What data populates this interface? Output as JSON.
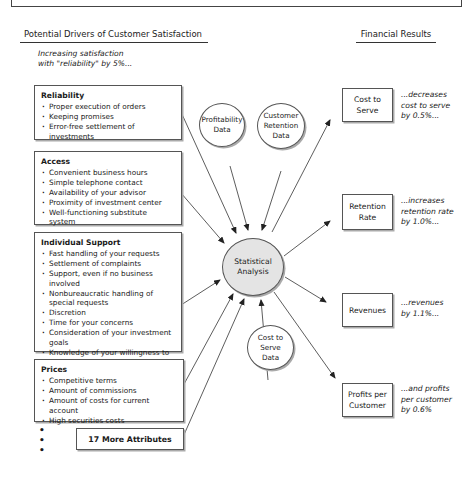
{
  "headers": {
    "drivers": "Potential Drivers of Customer Satisfaction",
    "results": "Financial Results"
  },
  "intro": {
    "line1": "Increasing satisfaction",
    "line2": "with \"reliability\" by 5%..."
  },
  "drivers": [
    {
      "title": "Reliability",
      "items": [
        "Proper execution of orders",
        "Keeping promises",
        "Error-free settlement of investments"
      ]
    },
    {
      "title": "Access",
      "items": [
        "Convenient business hours",
        "Simple telephone contact",
        "Availability of your advisor",
        "Proximity of investment center",
        "Well-functioning substitute system"
      ]
    },
    {
      "title": "Individual Support",
      "items": [
        "Fast handling of your requests",
        "Settlement of complaints",
        "Support, even if no business involved",
        "Nonbureaucratic handling of special requests",
        "Discretion",
        "Time for your concerns",
        "Consideration of your investment goals",
        "Knowledge of your willingness to take risks"
      ]
    },
    {
      "title": "Prices",
      "items": [
        "Competitive terms",
        "Amount of commissions",
        "Amount of costs for current account",
        "High securities costs"
      ]
    }
  ],
  "more_attributes": "17 More Attributes",
  "ellipsis_dots": [
    "•",
    "•",
    "•"
  ],
  "data_sources": {
    "profitability": [
      "Profitability",
      "Data"
    ],
    "retention": [
      "Customer",
      "Retention",
      "Data"
    ],
    "cost_to_serve": [
      "Cost to",
      "Serve",
      "Data"
    ]
  },
  "center": [
    "Statistical",
    "Analysis"
  ],
  "results": [
    {
      "label": [
        "Cost to",
        "Serve"
      ],
      "effect": [
        "...decreases",
        "cost to serve",
        "by 0.5%..."
      ]
    },
    {
      "label": [
        "Retention",
        "Rate"
      ],
      "effect": [
        "...increases",
        "retention rate",
        "by 1.0%..."
      ]
    },
    {
      "label": [
        "Revenues"
      ],
      "effect": [
        "...revenues",
        "by 1.1%..."
      ]
    },
    {
      "label": [
        "Profits per",
        "Customer"
      ],
      "effect": [
        "...and profits",
        "per customer",
        "by 0.6%"
      ]
    }
  ],
  "colors": {
    "line": "#333333",
    "center_fill": "#e4e4e4",
    "box_border": "#555555"
  }
}
